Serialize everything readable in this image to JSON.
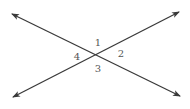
{
  "diagram": {
    "type": "intersecting-lines",
    "line_color": "#3a3a3a",
    "label_color": "#555555",
    "intersection": {
      "x": 96,
      "y": 54
    },
    "lines": [
      {
        "name": "line-a",
        "from": {
          "x": 12,
          "y": 14
        },
        "to": {
          "x": 180,
          "y": 96
        },
        "arrows": "both"
      },
      {
        "name": "line-b",
        "from": {
          "x": 13,
          "y": 97
        },
        "to": {
          "x": 179,
          "y": 12
        },
        "arrows": "both"
      }
    ],
    "angle_labels": [
      {
        "text": "1",
        "x": 98,
        "y": 46
      },
      {
        "text": "2",
        "x": 121,
        "y": 57
      },
      {
        "text": "3",
        "x": 98,
        "y": 72
      },
      {
        "text": "4",
        "x": 77,
        "y": 60
      }
    ]
  }
}
